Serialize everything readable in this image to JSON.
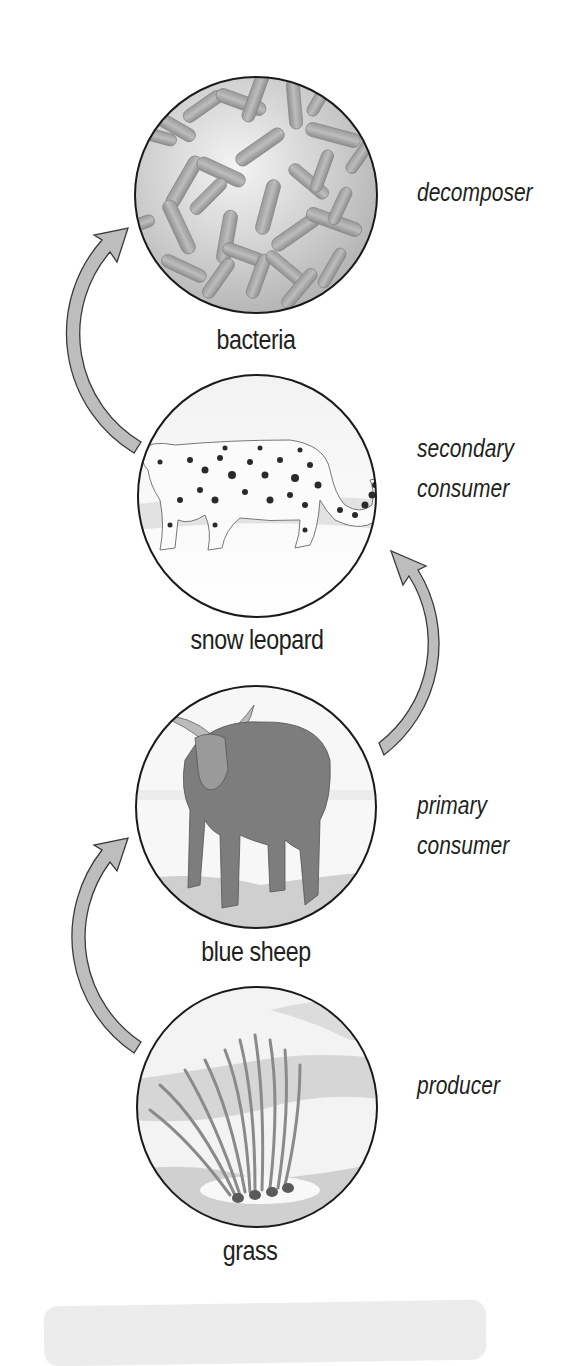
{
  "diagram": {
    "type": "food-chain",
    "direction": "bottom-to-top",
    "colors": {
      "arrow_fill": "#bdbdbd",
      "arrow_stroke": "#3a3a3a",
      "circle_stroke": "#1a1a1a",
      "text": "#231f20",
      "footer_box": "#ececec"
    },
    "levels": [
      {
        "organism": "bacteria",
        "role": "decomposer",
        "icon": "bacteria-icon"
      },
      {
        "organism": "snow leopard",
        "role_line1": "secondary",
        "role_line2": "consumer",
        "icon": "snow-leopard-icon"
      },
      {
        "organism": "blue sheep",
        "role_line1": "primary",
        "role_line2": "consumer",
        "icon": "blue-sheep-icon"
      },
      {
        "organism": "grass",
        "role": "producer",
        "icon": "grass-icon"
      }
    ],
    "arrows": [
      {
        "from": "grass",
        "to": "blue sheep",
        "side": "left"
      },
      {
        "from": "blue sheep",
        "to": "snow leopard",
        "side": "right"
      },
      {
        "from": "snow leopard",
        "to": "bacteria",
        "side": "left"
      }
    ]
  }
}
